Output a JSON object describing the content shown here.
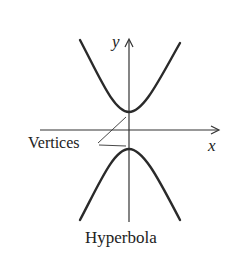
{
  "figure": {
    "caption": "Hyperbola",
    "axes": {
      "x_label": "x",
      "y_label": "y"
    },
    "annotation": "Vertices",
    "colors": {
      "curve": "#2a2a2a",
      "axis": "#333333",
      "background": "#ffffff"
    }
  }
}
